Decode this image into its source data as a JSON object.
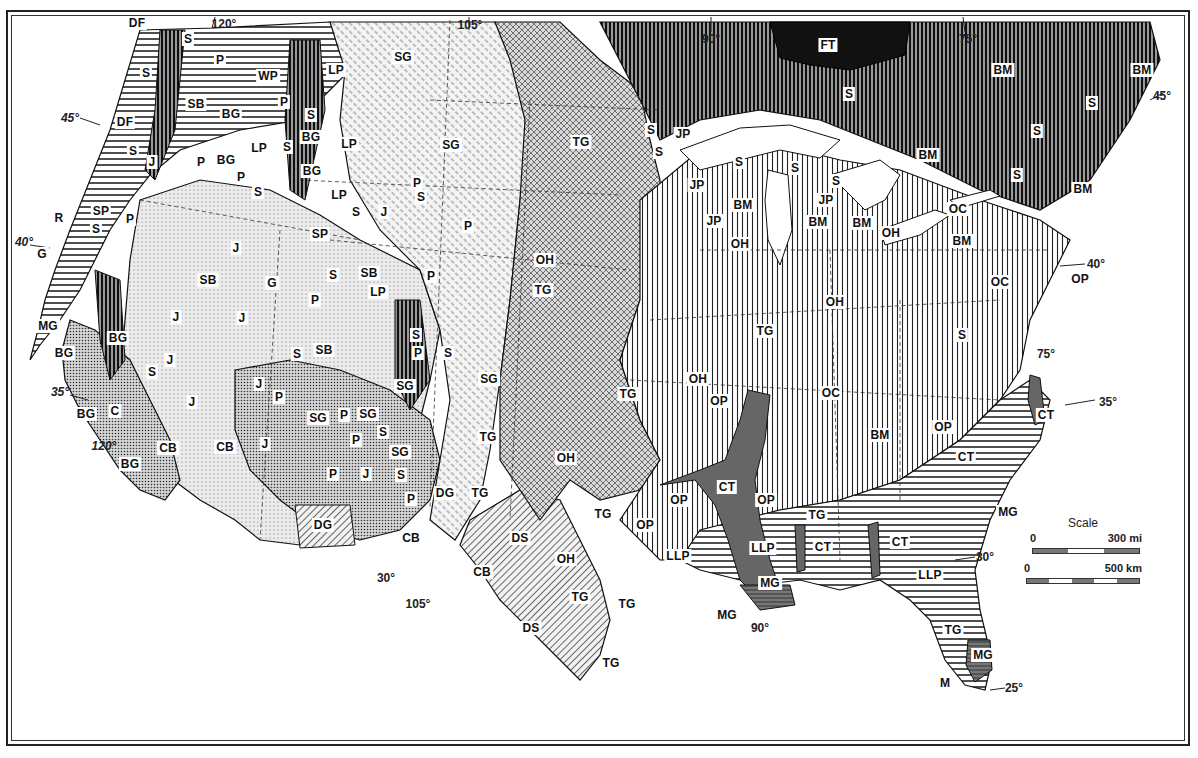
{
  "figure": {
    "frame": "double-rule border"
  },
  "latitude_markers": [
    {
      "text": "45°",
      "x": 70,
      "y": 118,
      "italic": true
    },
    {
      "text": "40°",
      "x": 24,
      "y": 242,
      "italic": true
    },
    {
      "text": "35°",
      "x": 60,
      "y": 392,
      "italic": true
    },
    {
      "text": "30°",
      "x": 386,
      "y": 578,
      "italic": false
    },
    {
      "text": "45°",
      "x": 1162,
      "y": 96,
      "italic": false
    },
    {
      "text": "40°",
      "x": 1096,
      "y": 264,
      "italic": false
    },
    {
      "text": "35°",
      "x": 1108,
      "y": 402,
      "italic": false
    },
    {
      "text": "30°",
      "x": 985,
      "y": 557,
      "italic": false
    },
    {
      "text": "25°",
      "x": 1014,
      "y": 688,
      "italic": false
    }
  ],
  "longitude_markers": [
    {
      "text": "120°",
      "x": 224,
      "y": 24,
      "italic": false
    },
    {
      "text": "105°",
      "x": 470,
      "y": 25,
      "italic": false
    },
    {
      "text": "90°",
      "x": 711,
      "y": 39,
      "italic": false
    },
    {
      "text": "75°",
      "x": 968,
      "y": 39,
      "italic": false
    },
    {
      "text": "120°",
      "x": 104,
      "y": 446,
      "italic": true
    },
    {
      "text": "105°",
      "x": 418,
      "y": 604,
      "italic": false
    },
    {
      "text": "90°",
      "x": 760,
      "y": 628,
      "italic": false
    },
    {
      "text": "75°",
      "x": 1046,
      "y": 354,
      "italic": false
    }
  ],
  "region_labels": [
    {
      "code": "DF",
      "x": 137,
      "y": 23
    },
    {
      "code": "S",
      "x": 188,
      "y": 39
    },
    {
      "code": "P",
      "x": 220,
      "y": 60
    },
    {
      "code": "S",
      "x": 146,
      "y": 73
    },
    {
      "code": "WP",
      "x": 268,
      "y": 76
    },
    {
      "code": "LP",
      "x": 336,
      "y": 70
    },
    {
      "code": "SG",
      "x": 403,
      "y": 57
    },
    {
      "code": "SB",
      "x": 196,
      "y": 104
    },
    {
      "code": "BG",
      "x": 231,
      "y": 114
    },
    {
      "code": "P",
      "x": 284,
      "y": 102
    },
    {
      "code": "S",
      "x": 311,
      "y": 115
    },
    {
      "code": "DF",
      "x": 125,
      "y": 122
    },
    {
      "code": "S",
      "x": 133,
      "y": 151
    },
    {
      "code": "BG",
      "x": 311,
      "y": 137
    },
    {
      "code": "LP",
      "x": 349,
      "y": 144
    },
    {
      "code": "LP",
      "x": 259,
      "y": 148
    },
    {
      "code": "S",
      "x": 287,
      "y": 147
    },
    {
      "code": "J",
      "x": 152,
      "y": 162
    },
    {
      "code": "P",
      "x": 201,
      "y": 162
    },
    {
      "code": "BG",
      "x": 226,
      "y": 160
    },
    {
      "code": "P",
      "x": 241,
      "y": 177
    },
    {
      "code": "BG",
      "x": 312,
      "y": 171
    },
    {
      "code": "S",
      "x": 258,
      "y": 192
    },
    {
      "code": "SG",
      "x": 451,
      "y": 145
    },
    {
      "code": "LP",
      "x": 339,
      "y": 195
    },
    {
      "code": "P",
      "x": 417,
      "y": 183
    },
    {
      "code": "S",
      "x": 421,
      "y": 197
    },
    {
      "code": "S",
      "x": 356,
      "y": 212
    },
    {
      "code": "J",
      "x": 384,
      "y": 212
    },
    {
      "code": "R",
      "x": 59,
      "y": 218
    },
    {
      "code": "SP",
      "x": 101,
      "y": 211
    },
    {
      "code": "P",
      "x": 130,
      "y": 219
    },
    {
      "code": "S",
      "x": 96,
      "y": 229
    },
    {
      "code": "SP",
      "x": 320,
      "y": 234
    },
    {
      "code": "P",
      "x": 468,
      "y": 226
    },
    {
      "code": "G",
      "x": 42,
      "y": 254
    },
    {
      "code": "J",
      "x": 236,
      "y": 248
    },
    {
      "code": "SB",
      "x": 208,
      "y": 280
    },
    {
      "code": "G",
      "x": 272,
      "y": 283
    },
    {
      "code": "S",
      "x": 333,
      "y": 275
    },
    {
      "code": "SB",
      "x": 369,
      "y": 273
    },
    {
      "code": "P",
      "x": 431,
      "y": 276
    },
    {
      "code": "P",
      "x": 315,
      "y": 300
    },
    {
      "code": "LP",
      "x": 378,
      "y": 292
    },
    {
      "code": "MG",
      "x": 48,
      "y": 326
    },
    {
      "code": "J",
      "x": 176,
      "y": 317
    },
    {
      "code": "J",
      "x": 242,
      "y": 318
    },
    {
      "code": "BG",
      "x": 118,
      "y": 338
    },
    {
      "code": "BG",
      "x": 64,
      "y": 353
    },
    {
      "code": "S",
      "x": 416,
      "y": 335
    },
    {
      "code": "J",
      "x": 170,
      "y": 360
    },
    {
      "code": "S",
      "x": 297,
      "y": 354
    },
    {
      "code": "SB",
      "x": 324,
      "y": 350
    },
    {
      "code": "P",
      "x": 418,
      "y": 353
    },
    {
      "code": "S",
      "x": 448,
      "y": 353
    },
    {
      "code": "S",
      "x": 152,
      "y": 372
    },
    {
      "code": "J",
      "x": 259,
      "y": 384
    },
    {
      "code": "SG",
      "x": 405,
      "y": 386
    },
    {
      "code": "J",
      "x": 192,
      "y": 402
    },
    {
      "code": "P",
      "x": 279,
      "y": 397
    },
    {
      "code": "BG",
      "x": 86,
      "y": 414
    },
    {
      "code": "C",
      "x": 115,
      "y": 411
    },
    {
      "code": "SG",
      "x": 318,
      "y": 418
    },
    {
      "code": "P",
      "x": 344,
      "y": 415
    },
    {
      "code": "SG",
      "x": 368,
      "y": 414
    },
    {
      "code": "P",
      "x": 356,
      "y": 440
    },
    {
      "code": "S",
      "x": 383,
      "y": 432
    },
    {
      "code": "SG",
      "x": 400,
      "y": 452
    },
    {
      "code": "J",
      "x": 265,
      "y": 444
    },
    {
      "code": "BG",
      "x": 130,
      "y": 464
    },
    {
      "code": "CB",
      "x": 168,
      "y": 448
    },
    {
      "code": "CB",
      "x": 225,
      "y": 447
    },
    {
      "code": "TG",
      "x": 488,
      "y": 437
    },
    {
      "code": "P",
      "x": 333,
      "y": 474
    },
    {
      "code": "J",
      "x": 366,
      "y": 474
    },
    {
      "code": "S",
      "x": 401,
      "y": 475
    },
    {
      "code": "P",
      "x": 411,
      "y": 499
    },
    {
      "code": "DG",
      "x": 445,
      "y": 493
    },
    {
      "code": "TG",
      "x": 480,
      "y": 493
    },
    {
      "code": "DG",
      "x": 323,
      "y": 525
    },
    {
      "code": "CB",
      "x": 411,
      "y": 538
    },
    {
      "code": "DS",
      "x": 520,
      "y": 538
    },
    {
      "code": "CB",
      "x": 482,
      "y": 572
    },
    {
      "code": "DS",
      "x": 531,
      "y": 628
    },
    {
      "code": "TG",
      "x": 611,
      "y": 663
    },
    {
      "code": "OH",
      "x": 545,
      "y": 260
    },
    {
      "code": "TG",
      "x": 581,
      "y": 142
    },
    {
      "code": "TG",
      "x": 543,
      "y": 290
    },
    {
      "code": "SG",
      "x": 489,
      "y": 379
    },
    {
      "code": "TG",
      "x": 628,
      "y": 394
    },
    {
      "code": "OH",
      "x": 566,
      "y": 559
    },
    {
      "code": "TG",
      "x": 603,
      "y": 514
    },
    {
      "code": "TG",
      "x": 580,
      "y": 597
    },
    {
      "code": "TG",
      "x": 627,
      "y": 604
    },
    {
      "code": "OH",
      "x": 566,
      "y": 458
    },
    {
      "code": "OP",
      "x": 679,
      "y": 500
    },
    {
      "code": "OP",
      "x": 645,
      "y": 525
    },
    {
      "code": "LLP",
      "x": 678,
      "y": 556
    },
    {
      "code": "CT",
      "x": 727,
      "y": 487
    },
    {
      "code": "OP",
      "x": 766,
      "y": 500
    },
    {
      "code": "OH",
      "x": 698,
      "y": 379
    },
    {
      "code": "OP",
      "x": 719,
      "y": 401
    },
    {
      "code": "TG",
      "x": 765,
      "y": 331
    },
    {
      "code": "MG",
      "x": 770,
      "y": 583
    },
    {
      "code": "MG",
      "x": 727,
      "y": 615
    },
    {
      "code": "S",
      "x": 651,
      "y": 130
    },
    {
      "code": "JP",
      "x": 683,
      "y": 134
    },
    {
      "code": "S",
      "x": 659,
      "y": 152
    },
    {
      "code": "S",
      "x": 739,
      "y": 162
    },
    {
      "code": "JP",
      "x": 697,
      "y": 185
    },
    {
      "code": "BM",
      "x": 743,
      "y": 205
    },
    {
      "code": "JP",
      "x": 714,
      "y": 221
    },
    {
      "code": "OH",
      "x": 740,
      "y": 244
    },
    {
      "code": "S",
      "x": 795,
      "y": 168
    },
    {
      "code": "S",
      "x": 836,
      "y": 181
    },
    {
      "code": "JP",
      "x": 826,
      "y": 200
    },
    {
      "code": "BM",
      "x": 818,
      "y": 222
    },
    {
      "code": "BM",
      "x": 862,
      "y": 223
    },
    {
      "code": "OH",
      "x": 891,
      "y": 233
    },
    {
      "code": "OH",
      "x": 835,
      "y": 302
    },
    {
      "code": "FT",
      "x": 828,
      "y": 45
    },
    {
      "code": "S",
      "x": 849,
      "y": 94
    },
    {
      "code": "BM",
      "x": 928,
      "y": 155
    },
    {
      "code": "BM",
      "x": 1003,
      "y": 70
    },
    {
      "code": "BM",
      "x": 1142,
      "y": 70
    },
    {
      "code": "S",
      "x": 1092,
      "y": 103
    },
    {
      "code": "S",
      "x": 1037,
      "y": 131
    },
    {
      "code": "S",
      "x": 1017,
      "y": 175
    },
    {
      "code": "BM",
      "x": 1083,
      "y": 189
    },
    {
      "code": "OC",
      "x": 958,
      "y": 209
    },
    {
      "code": "BM",
      "x": 962,
      "y": 241
    },
    {
      "code": "OC",
      "x": 1000,
      "y": 282
    },
    {
      "code": "OP",
      "x": 1080,
      "y": 279
    },
    {
      "code": "S",
      "x": 962,
      "y": 335
    },
    {
      "code": "OC",
      "x": 831,
      "y": 393
    },
    {
      "code": "BM",
      "x": 880,
      "y": 435
    },
    {
      "code": "OP",
      "x": 943,
      "y": 427
    },
    {
      "code": "CT",
      "x": 1046,
      "y": 415
    },
    {
      "code": "CT",
      "x": 966,
      "y": 457
    },
    {
      "code": "MG",
      "x": 1008,
      "y": 512
    },
    {
      "code": "TG",
      "x": 817,
      "y": 515
    },
    {
      "code": "LLP",
      "x": 763,
      "y": 548
    },
    {
      "code": "CT",
      "x": 823,
      "y": 547
    },
    {
      "code": "CT",
      "x": 900,
      "y": 542
    },
    {
      "code": "LLP",
      "x": 930,
      "y": 575
    },
    {
      "code": "TG",
      "x": 953,
      "y": 630
    },
    {
      "code": "MG",
      "x": 983,
      "y": 655
    },
    {
      "code": "M",
      "x": 945,
      "y": 683
    }
  ],
  "scale_bar": {
    "title": "Scale",
    "miles": {
      "start": "0",
      "end": "300 mi"
    },
    "kilometers": {
      "start": "0",
      "end": "500 km"
    }
  },
  "legend_codes_present": [
    "DF",
    "S",
    "P",
    "WP",
    "LP",
    "SG",
    "SB",
    "BG",
    "J",
    "R",
    "SP",
    "G",
    "MG",
    "C",
    "CB",
    "DG",
    "DS",
    "TG",
    "OH",
    "OP",
    "LLP",
    "CT",
    "FT",
    "BM",
    "JP",
    "OC",
    "M"
  ]
}
